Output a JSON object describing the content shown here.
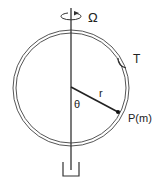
{
  "diagram": {
    "labels": {
      "omega": "Ω",
      "hoop": "T",
      "theta": "θ",
      "radius": "r",
      "point": "P(m)"
    },
    "colors": {
      "stroke": "#333333",
      "hoop": "#555555",
      "text": "#222222",
      "background": "#ffffff"
    },
    "elements": [
      {
        "name": "rotation-axis",
        "description": "vertical axis of rotation"
      },
      {
        "name": "hoop",
        "description": "circular ring (double line)"
      },
      {
        "name": "radius-line",
        "description": "line from center to point P"
      },
      {
        "name": "mass-point",
        "description": "bead of mass m on hoop"
      },
      {
        "name": "rotation-arrow-icon",
        "description": "angular velocity indicator"
      },
      {
        "name": "base-support",
        "description": "U-shaped bearing at bottom"
      }
    ]
  }
}
